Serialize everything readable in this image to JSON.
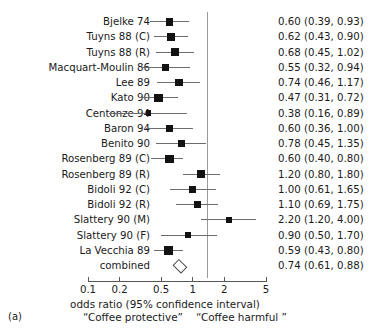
{
  "figure": {
    "panel_letter": "(a)",
    "axis_title": "odds ratio (95% confidence interval)",
    "note_left": "“Coffee protective”",
    "note_right": "“Coffee harmful ”",
    "reference_value": 1
  },
  "chart_data": {
    "type": "forest",
    "title": "",
    "xlabel": "odds ratio (95% confidence interval)",
    "ylabel": "",
    "xscale": "log",
    "xlim": [
      0.1,
      5
    ],
    "ticks": [
      "0.1",
      "0.2",
      "0.5",
      "1",
      "2",
      "5"
    ],
    "tick_values": [
      0.1,
      0.2,
      0.5,
      1,
      2,
      5
    ],
    "grid": false,
    "reference_line": 1,
    "legend": [],
    "annotations": [
      "“Coffee protective”",
      "“Coffee harmful ”"
    ],
    "columns": [
      "study",
      "odds ratio (95% confidence interval)"
    ],
    "studies": [
      {
        "label": "Bjelke 74",
        "estimate": 0.6,
        "low": 0.39,
        "high": 0.93,
        "stat": "0.60 (0.39, 0.93)",
        "weight": 0.62,
        "summary": false
      },
      {
        "label": "Tuyns 88 (C)",
        "estimate": 0.62,
        "low": 0.43,
        "high": 0.9,
        "stat": "0.62 (0.43, 0.90)",
        "weight": 0.6,
        "summary": false
      },
      {
        "label": "Tuyns 88 (R)",
        "estimate": 0.68,
        "low": 0.45,
        "high": 1.02,
        "stat": "0.68 (0.45, 1.02)",
        "weight": 0.62,
        "summary": false
      },
      {
        "label": "Macquart-Moulin 86",
        "estimate": 0.55,
        "low": 0.32,
        "high": 0.94,
        "stat": "0.55 (0.32, 0.94)",
        "weight": 0.5,
        "summary": false
      },
      {
        "label": "Lee 89",
        "estimate": 0.74,
        "low": 0.46,
        "high": 1.17,
        "stat": "0.74 (0.46, 1.17)",
        "weight": 0.54,
        "summary": false
      },
      {
        "label": "Kato 90",
        "estimate": 0.47,
        "low": 0.31,
        "high": 0.72,
        "stat": "0.47 (0.31, 0.72)",
        "weight": 0.68,
        "summary": false
      },
      {
        "label": "Centonze 94",
        "estimate": 0.38,
        "low": 0.16,
        "high": 0.89,
        "stat": "0.38 (0.16, 0.89)",
        "weight": 0.3,
        "summary": false
      },
      {
        "label": "Baron 94",
        "estimate": 0.6,
        "low": 0.36,
        "high": 1.0,
        "stat": "0.60 (0.36, 1.00)",
        "weight": 0.52,
        "summary": false
      },
      {
        "label": "Benito 90",
        "estimate": 0.78,
        "low": 0.45,
        "high": 1.35,
        "stat": "0.78 (0.45, 1.35)",
        "weight": 0.5,
        "summary": false
      },
      {
        "label": "Rosenberg 89 (C)",
        "estimate": 0.6,
        "low": 0.4,
        "high": 0.8,
        "stat": "0.60 (0.40, 0.80)",
        "weight": 0.72,
        "summary": false
      },
      {
        "label": "Rosenberg 89 (R)",
        "estimate": 1.2,
        "low": 0.8,
        "high": 1.8,
        "stat": "1.20 (0.80, 1.80)",
        "weight": 0.62,
        "summary": false
      },
      {
        "label": "Bidoli 92 (C)",
        "estimate": 1.0,
        "low": 0.61,
        "high": 1.65,
        "stat": "1.00 (0.61, 1.65)",
        "weight": 0.5,
        "summary": false
      },
      {
        "label": "Bidoli 92 (R)",
        "estimate": 1.1,
        "low": 0.69,
        "high": 1.75,
        "stat": "1.10 (0.69, 1.75)",
        "weight": 0.52,
        "summary": false
      },
      {
        "label": "Slattery 90 (M)",
        "estimate": 2.2,
        "low": 1.2,
        "high": 4.0,
        "stat": "2.20 (1.20, 4.00)",
        "weight": 0.4,
        "summary": false
      },
      {
        "label": "Slattery 90 (F)",
        "estimate": 0.9,
        "low": 0.5,
        "high": 1.7,
        "stat": "0.90 (0.50, 1.70)",
        "weight": 0.44,
        "summary": false
      },
      {
        "label": "La Vecchia 89",
        "estimate": 0.59,
        "low": 0.43,
        "high": 0.8,
        "stat": "0.59 (0.43, 0.80)",
        "weight": 0.74,
        "summary": false
      },
      {
        "label": "combined",
        "estimate": 0.74,
        "low": 0.61,
        "high": 0.88,
        "stat": "0.74 (0.61, 0.88)",
        "weight": 1.0,
        "summary": true
      }
    ]
  }
}
